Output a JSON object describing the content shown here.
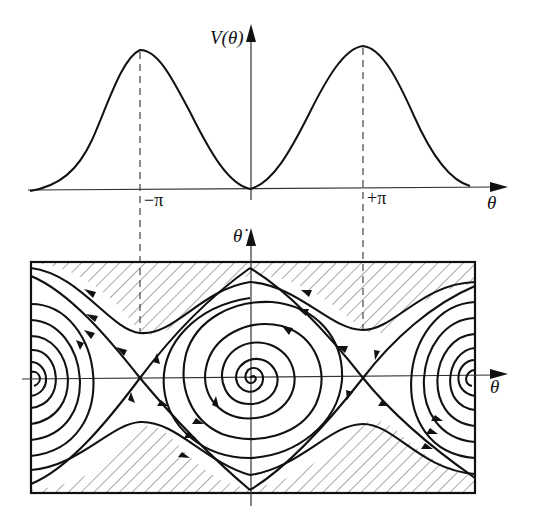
{
  "figure": {
    "top_panel": {
      "name": "potential-energy-plot",
      "y_axis_label": "V(θ)",
      "x_axis_label": "θ",
      "tick_labels": [
        {
          "text": "−π",
          "x": 140
        },
        {
          "text": "+π",
          "x": 363
        }
      ],
      "curve": "V(θ) = 1 − cos θ over roughly θ ∈ [−2π, 2π], with maxima at ±π and minimum at 0"
    },
    "bottom_panel": {
      "name": "phase-portrait",
      "y_axis_label": "θ̇",
      "x_axis_label": "θ",
      "features": {
        "stable_spiral_centers": [
          "θ = 0",
          "θ = −2π (left edge)",
          "θ = +2π (right edge)"
        ],
        "saddle_points": [
          "θ = −π",
          "θ = +π"
        ],
        "hatched_regions": "domains of attraction of the edge equilibria shaded with diagonal hatching"
      }
    },
    "colors": {
      "ink": "#111111",
      "axis": "#333333",
      "hatch": "#555555",
      "background": "#ffffff"
    }
  }
}
